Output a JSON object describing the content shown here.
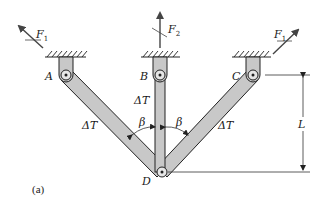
{
  "figure": {
    "caption": "(a)",
    "colors": {
      "bar_fill": "#c8c8c8",
      "outline": "#222222",
      "force_arrow": "#444444",
      "background": "#ffffff"
    }
  },
  "supports": [
    {
      "id": "A",
      "label": "A"
    },
    {
      "id": "B",
      "label": "B"
    },
    {
      "id": "C",
      "label": "C"
    }
  ],
  "joint": {
    "id": "D",
    "label": "D"
  },
  "bars": [
    {
      "id": "AD",
      "label": "ΔT"
    },
    {
      "id": "BD",
      "label": "ΔT"
    },
    {
      "id": "CD",
      "label": "ΔT"
    }
  ],
  "angles": [
    {
      "id": "left",
      "label": "β"
    },
    {
      "id": "right",
      "label": "β"
    }
  ],
  "forces": [
    {
      "id": "F1-left",
      "symbol": "F",
      "subscript": "1"
    },
    {
      "id": "F2",
      "symbol": "F",
      "subscript": "2"
    },
    {
      "id": "F1-right",
      "symbol": "F",
      "subscript": "1"
    }
  ],
  "dimension": {
    "label": "L"
  }
}
